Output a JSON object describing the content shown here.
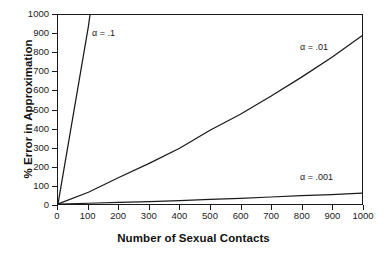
{
  "chart_data": {
    "type": "line",
    "title": "",
    "xlabel": "Number of Sexual Contacts",
    "ylabel": "% Error in Approximation",
    "xlim": [
      0,
      1000
    ],
    "ylim": [
      0,
      1000
    ],
    "grid": false,
    "legend_position": "inline-annotations",
    "x_ticks": [
      "0",
      "100",
      "200",
      "300",
      "400",
      "500",
      "600",
      "700",
      "800",
      "900",
      "1000"
    ],
    "y_ticks": [
      "0",
      "100",
      "200",
      "300",
      "400",
      "500",
      "600",
      "700",
      "800",
      "900",
      "1000"
    ],
    "x": [
      0,
      100,
      200,
      300,
      400,
      500,
      600,
      700,
      800,
      900,
      1000
    ],
    "series": [
      {
        "name": "α = .1",
        "label": "α = .1",
        "values": [
          0,
          940,
          2090,
          3470,
          5130,
          7120,
          9500,
          12360,
          15790,
          19900,
          24830
        ],
        "color": "#1a1a1a"
      },
      {
        "name": "α = .01",
        "label": "α = .01",
        "values": [
          0,
          62,
          140,
          215,
          295,
          390,
          475,
          570,
          670,
          775,
          890
        ],
        "color": "#1a1a1a"
      },
      {
        "name": "α = .001",
        "label": "α = .001",
        "values": [
          0,
          4,
          8,
          13,
          18,
          24,
          30,
          37,
          44,
          50,
          57
        ],
        "color": "#1a1a1a"
      }
    ],
    "annotations": [
      {
        "text": "α = .1",
        "x": 115,
        "y": 930
      },
      {
        "text": "α = .01",
        "x": 800,
        "y": 855
      },
      {
        "text": "α = .001",
        "x": 800,
        "y": 165
      }
    ]
  }
}
